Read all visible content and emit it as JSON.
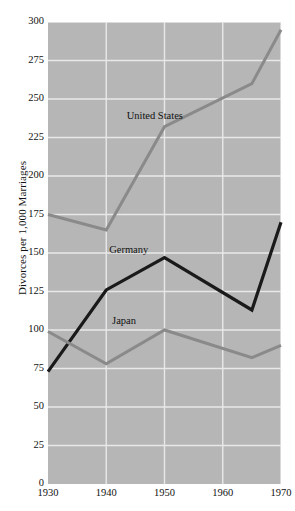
{
  "chart_data": {
    "type": "line",
    "title": "",
    "subtitle": "",
    "xlabel": "",
    "ylabel": "Divorces per 1,000 Marriages",
    "x": [
      1930,
      1940,
      1950,
      1965,
      1970
    ],
    "xlim": [
      1930,
      1970
    ],
    "ylim": [
      0,
      300
    ],
    "xticks": [
      "1930",
      "1940",
      "1950",
      "1960",
      "1970"
    ],
    "xtick_values": [
      1930,
      1940,
      1950,
      1960,
      1970
    ],
    "yticks": [
      "0",
      "25",
      "50",
      "75",
      "100",
      "125",
      "150",
      "175",
      "200",
      "225",
      "250",
      "275",
      "300"
    ],
    "ytick_values": [
      0,
      25,
      50,
      75,
      100,
      125,
      150,
      175,
      200,
      225,
      250,
      275,
      300
    ],
    "grid": true,
    "grid_color": "#e8e8e8",
    "plot_background": "#b6b6b6",
    "legend_position": "inline-annotations",
    "series": [
      {
        "name": "United States",
        "color": "#8a8a8a",
        "values": [
          175,
          165,
          232,
          260,
          295
        ],
        "label_x": 1943.5,
        "label_y": 238
      },
      {
        "name": "Germany",
        "color": "#1a1a1a",
        "values": [
          73,
          126,
          147,
          113,
          170
        ],
        "label_x": 1940.5,
        "label_y": 151
      },
      {
        "name": "Japan",
        "color": "#8a8a8a",
        "values": [
          99,
          78,
          100,
          82,
          90
        ],
        "label_x": 1941.0,
        "label_y": 105
      }
    ],
    "annotations": [
      {
        "text": "United States",
        "series": "United States"
      },
      {
        "text": "Germany",
        "series": "Germany"
      },
      {
        "text": "Japan",
        "series": "Japan"
      }
    ]
  }
}
